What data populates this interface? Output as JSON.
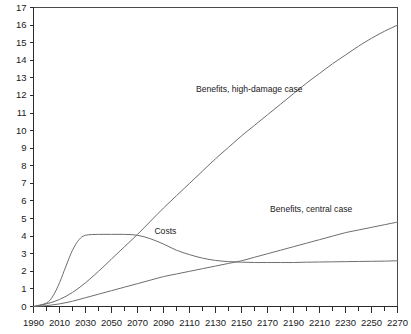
{
  "chart_data": {
    "type": "line",
    "title": "",
    "subtitle": "",
    "xlabel": "",
    "ylabel": "",
    "xlim": [
      1990,
      2270
    ],
    "ylim": [
      0,
      17
    ],
    "grid": false,
    "legend_position": "inline-annotations",
    "x_tick_labels": [
      "1990",
      "2010",
      "2030",
      "2050",
      "2070",
      "2090",
      "2110",
      "2130",
      "2150",
      "2170",
      "2190",
      "2210",
      "2230",
      "2250",
      "2270"
    ],
    "x_tick_values": [
      1990,
      2010,
      2030,
      2050,
      2070,
      2090,
      2110,
      2130,
      2150,
      2170,
      2190,
      2210,
      2230,
      2250,
      2270
    ],
    "x_minor_tick_values": [
      2000,
      2020,
      2040,
      2060,
      2080,
      2100,
      2120,
      2140,
      2160,
      2180,
      2200,
      2220,
      2240,
      2260
    ],
    "y_tick_labels": [
      "0",
      "1",
      "2",
      "3",
      "4",
      "5",
      "6",
      "7",
      "8",
      "9",
      "10",
      "11",
      "12",
      "13",
      "14",
      "15",
      "16",
      "17"
    ],
    "y_tick_values": [
      0,
      1,
      2,
      3,
      4,
      5,
      6,
      7,
      8,
      9,
      10,
      11,
      12,
      13,
      14,
      15,
      16,
      17
    ],
    "series": [
      {
        "name": "Benefits, high-damage case",
        "label": "Benefits, high-damage case",
        "color": "#6e6e6e",
        "label_x": 2115,
        "label_y": 12.2,
        "x": [
          1990,
          2000,
          2010,
          2020,
          2030,
          2040,
          2050,
          2060,
          2070,
          2080,
          2090,
          2100,
          2110,
          2120,
          2130,
          2140,
          2150,
          2160,
          2170,
          2180,
          2190,
          2200,
          2210,
          2220,
          2230,
          2240,
          2250,
          2260,
          2270
        ],
        "y": [
          0.0,
          0.15,
          0.4,
          0.8,
          1.35,
          2.0,
          2.7,
          3.4,
          4.1,
          4.85,
          5.6,
          6.3,
          7.0,
          7.7,
          8.4,
          9.05,
          9.7,
          10.3,
          10.9,
          11.5,
          12.1,
          12.7,
          13.25,
          13.8,
          14.3,
          14.8,
          15.25,
          15.65,
          16.0
        ]
      },
      {
        "name": "Benefits, central case",
        "label": "Benefits, central case",
        "color": "#6e6e6e",
        "label_x": 2172,
        "label_y": 5.35,
        "x": [
          1990,
          2000,
          2010,
          2020,
          2030,
          2040,
          2050,
          2060,
          2070,
          2080,
          2090,
          2100,
          2110,
          2120,
          2130,
          2140,
          2150,
          2160,
          2170,
          2180,
          2190,
          2200,
          2210,
          2220,
          2230,
          2240,
          2250,
          2260,
          2270
        ],
        "y": [
          0.0,
          0.05,
          0.15,
          0.3,
          0.5,
          0.7,
          0.9,
          1.1,
          1.3,
          1.5,
          1.7,
          1.85,
          2.0,
          2.15,
          2.3,
          2.45,
          2.6,
          2.8,
          3.0,
          3.2,
          3.4,
          3.6,
          3.8,
          4.0,
          4.2,
          4.35,
          4.5,
          4.65,
          4.8
        ]
      },
      {
        "name": "Costs",
        "label": "Costs",
        "color": "#6e6e6e",
        "label_x": 2083,
        "label_y": 4.15,
        "x": [
          1990,
          2000,
          2005,
          2010,
          2015,
          2020,
          2025,
          2030,
          2040,
          2050,
          2060,
          2070,
          2080,
          2090,
          2100,
          2110,
          2120,
          2130,
          2140,
          2150,
          2160,
          2170,
          2180,
          2190,
          2200,
          2210,
          2220,
          2230,
          2240,
          2250,
          2260,
          2270
        ],
        "y": [
          0.0,
          0.2,
          0.6,
          1.35,
          2.3,
          3.2,
          3.8,
          4.05,
          4.1,
          4.1,
          4.1,
          4.05,
          3.85,
          3.55,
          3.2,
          2.95,
          2.75,
          2.62,
          2.55,
          2.52,
          2.5,
          2.5,
          2.5,
          2.5,
          2.52,
          2.53,
          2.54,
          2.55,
          2.56,
          2.57,
          2.58,
          2.6
        ]
      }
    ]
  }
}
